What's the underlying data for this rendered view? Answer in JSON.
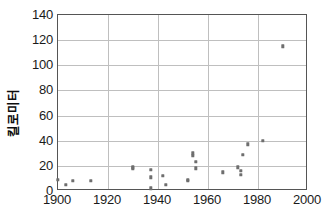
{
  "chart_data": {
    "type": "scatter",
    "title": "",
    "subtitle": "",
    "xlabel": "",
    "ylabel": "킬로미터",
    "xlim": [
      1900,
      2000
    ],
    "ylim": [
      0,
      140
    ],
    "xticks": [
      1900,
      1920,
      1940,
      1960,
      1980,
      2000
    ],
    "yticks": [
      0,
      20,
      40,
      60,
      80,
      100,
      120,
      140
    ],
    "grid": true,
    "legend": false,
    "legend_position": "none",
    "marker_color": "#6e6e6e",
    "gridline_color": "#bfbfbf",
    "frame_color": "#555555",
    "background_color": "#ffffff",
    "series": [
      {
        "name": "",
        "points": [
          {
            "x": 1900,
            "y": 9
          },
          {
            "x": 1903,
            "y": 5
          },
          {
            "x": 1906,
            "y": 8
          },
          {
            "x": 1913,
            "y": 8
          },
          {
            "x": 1930,
            "y": 19
          },
          {
            "x": 1930,
            "y": 18
          },
          {
            "x": 1937,
            "y": 17
          },
          {
            "x": 1937,
            "y": 11
          },
          {
            "x": 1937,
            "y": 2
          },
          {
            "x": 1942,
            "y": 12
          },
          {
            "x": 1943,
            "y": 5
          },
          {
            "x": 1952,
            "y": 8
          },
          {
            "x": 1952,
            "y": 9
          },
          {
            "x": 1954,
            "y": 30
          },
          {
            "x": 1954,
            "y": 28
          },
          {
            "x": 1955,
            "y": 23
          },
          {
            "x": 1955,
            "y": 18
          },
          {
            "x": 1966,
            "y": 15
          },
          {
            "x": 1972,
            "y": 19
          },
          {
            "x": 1973,
            "y": 16
          },
          {
            "x": 1973,
            "y": 13
          },
          {
            "x": 1974,
            "y": 29
          },
          {
            "x": 1976,
            "y": 37
          },
          {
            "x": 1982,
            "y": 40
          },
          {
            "x": 1990,
            "y": 115
          }
        ]
      }
    ]
  }
}
